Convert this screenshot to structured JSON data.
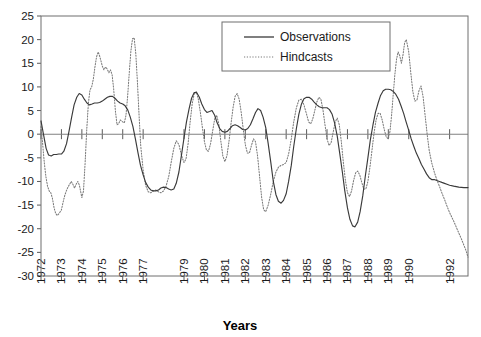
{
  "chart_data": {
    "type": "line",
    "title": "",
    "xlabel": "Years",
    "ylabel": "",
    "ylim": [
      -30,
      25
    ],
    "ytick_labels": [
      "25",
      "20",
      "15",
      "10",
      "5",
      "0",
      "-5",
      "-10",
      "-15",
      "-20",
      "-25",
      "-30"
    ],
    "ytick_values": [
      25,
      20,
      15,
      10,
      5,
      0,
      -5,
      -10,
      -15,
      -20,
      -25,
      -30
    ],
    "xtick_labels": [
      "1972",
      "1973",
      "1974",
      "1975",
      "1976",
      "1977",
      "1979",
      "1980",
      "1981",
      "1982",
      "1983",
      "1984",
      "1985",
      "1986",
      "1987",
      "1988",
      "1989",
      "1990",
      "1992"
    ],
    "xlim": [
      1972,
      1992.9
    ],
    "grid": false,
    "zero_line": true,
    "legend_position": "top-center-right",
    "legend": [
      "Observations",
      "Hindcasts"
    ],
    "series": [
      {
        "name": "Observations",
        "style": "solid",
        "color": "#3a3a3a",
        "x": [
          1972.0,
          1972.12,
          1972.25,
          1972.37,
          1972.5,
          1972.62,
          1972.75,
          1972.87,
          1973.0,
          1973.12,
          1973.25,
          1973.37,
          1973.5,
          1973.62,
          1973.75,
          1973.87,
          1974.0,
          1974.12,
          1974.25,
          1974.37,
          1974.5,
          1974.62,
          1974.75,
          1974.87,
          1975.0,
          1975.12,
          1975.25,
          1975.37,
          1975.5,
          1975.62,
          1975.75,
          1975.87,
          1976.0,
          1976.12,
          1976.25,
          1976.37,
          1976.5,
          1976.62,
          1976.75,
          1976.87,
          1977.0,
          1977.12,
          1977.25,
          1977.37,
          1977.5,
          1977.62,
          1977.75,
          1977.87,
          1978.0,
          1978.12,
          1978.25,
          1978.37,
          1978.5,
          1978.62,
          1978.75,
          1978.87,
          1979.0,
          1979.12,
          1979.25,
          1979.37,
          1979.5,
          1979.62,
          1979.75,
          1979.87,
          1980.0,
          1980.12,
          1980.25,
          1980.37,
          1980.5,
          1980.62,
          1980.75,
          1980.87,
          1981.0,
          1981.12,
          1981.25,
          1981.37,
          1981.5,
          1981.62,
          1981.75,
          1981.87,
          1982.0,
          1982.12,
          1982.25,
          1982.37,
          1982.5,
          1982.62,
          1982.75,
          1982.87,
          1983.0,
          1983.12,
          1983.25,
          1983.37,
          1983.5,
          1983.62,
          1983.75,
          1983.87,
          1984.0,
          1984.12,
          1984.25,
          1984.37,
          1984.5,
          1984.62,
          1984.75,
          1984.87,
          1985.0,
          1985.12,
          1985.25,
          1985.37,
          1985.5,
          1985.62,
          1985.75,
          1985.87,
          1986.0,
          1986.12,
          1986.25,
          1986.37,
          1986.5,
          1986.62,
          1986.75,
          1986.87,
          1987.0,
          1987.12,
          1987.25,
          1987.37,
          1987.5,
          1987.62,
          1987.75,
          1987.87,
          1988.0,
          1988.12,
          1988.25,
          1988.37,
          1988.5,
          1988.62,
          1988.75,
          1988.87,
          1989.0,
          1989.12,
          1989.25,
          1989.37,
          1989.5,
          1989.62,
          1989.75,
          1989.87,
          1990.0,
          1990.12,
          1990.25,
          1990.37,
          1990.5,
          1990.62,
          1990.75,
          1990.87,
          1991.0,
          1991.12,
          1991.25,
          1991.37,
          1991.5,
          1991.62,
          1991.75,
          1991.87,
          1992.0,
          1992.2,
          1992.45,
          1992.7,
          1992.9
        ],
        "y": [
          2.8,
          0.0,
          -3.0,
          -4.4,
          -4.6,
          -4.3,
          -4.3,
          -4.2,
          -4.2,
          -3.6,
          -2.0,
          0.6,
          3.6,
          6.2,
          7.8,
          8.6,
          8.3,
          7.4,
          6.6,
          6.2,
          6.4,
          6.6,
          6.6,
          6.7,
          7.0,
          7.4,
          7.8,
          8.0,
          8.0,
          7.6,
          7.0,
          6.6,
          6.4,
          6.0,
          5.1,
          3.6,
          1.6,
          -1.0,
          -4.0,
          -6.6,
          -8.6,
          -10.2,
          -11.2,
          -11.8,
          -12.0,
          -12.0,
          -11.8,
          -11.4,
          -11.2,
          -11.3,
          -11.6,
          -11.8,
          -11.6,
          -10.4,
          -8.0,
          -4.6,
          -0.8,
          2.6,
          5.4,
          7.6,
          8.8,
          8.8,
          7.8,
          6.4,
          5.2,
          4.6,
          4.8,
          5.0,
          4.0,
          2.4,
          1.2,
          0.6,
          0.4,
          0.6,
          1.2,
          1.8,
          2.0,
          1.8,
          1.4,
          1.0,
          0.9,
          1.2,
          2.0,
          3.2,
          4.6,
          5.4,
          5.0,
          3.6,
          1.4,
          -2.0,
          -6.0,
          -10.0,
          -12.8,
          -14.2,
          -14.6,
          -14.0,
          -12.6,
          -10.0,
          -6.6,
          -2.6,
          1.2,
          4.2,
          6.4,
          7.5,
          7.8,
          7.8,
          7.4,
          6.8,
          6.2,
          5.8,
          5.6,
          5.6,
          5.6,
          5.2,
          4.2,
          2.4,
          -0.4,
          -4.0,
          -8.0,
          -12.0,
          -15.6,
          -18.0,
          -19.4,
          -19.6,
          -18.6,
          -16.4,
          -13.0,
          -9.0,
          -5.0,
          -1.2,
          2.0,
          4.6,
          6.6,
          8.2,
          9.2,
          9.5,
          9.5,
          9.4,
          9.0,
          8.4,
          7.4,
          6.0,
          4.4,
          2.6,
          0.8,
          -1.0,
          -2.6,
          -4.0,
          -5.2,
          -6.4,
          -7.4,
          -8.4,
          -9.2,
          -9.6,
          -9.6,
          -9.8,
          -10.0,
          -10.2,
          -10.4,
          -10.6,
          -10.8,
          -11.0,
          -11.2,
          -11.3,
          -11.3
        ]
      },
      {
        "name": "Hindcasts",
        "style": "dotted",
        "color": "#7a7a7a",
        "x": [
          1972.0,
          1972.08,
          1972.16,
          1972.24,
          1972.32,
          1972.4,
          1972.48,
          1972.56,
          1972.64,
          1972.72,
          1972.8,
          1972.88,
          1973.0,
          1973.08,
          1973.16,
          1973.24,
          1973.32,
          1973.4,
          1973.48,
          1973.56,
          1973.64,
          1973.72,
          1973.8,
          1973.88,
          1974.0,
          1974.08,
          1974.16,
          1974.24,
          1974.32,
          1974.4,
          1974.48,
          1974.56,
          1974.64,
          1974.72,
          1974.8,
          1974.88,
          1975.0,
          1975.08,
          1975.16,
          1975.24,
          1975.32,
          1975.4,
          1975.48,
          1975.56,
          1975.64,
          1975.72,
          1975.8,
          1975.88,
          1976.0,
          1976.08,
          1976.16,
          1976.24,
          1976.32,
          1976.4,
          1976.48,
          1976.56,
          1976.64,
          1976.72,
          1976.8,
          1976.88,
          1977.0,
          1977.12,
          1977.25,
          1977.37,
          1977.5,
          1977.62,
          1977.75,
          1977.87,
          1978.0,
          1978.12,
          1978.25,
          1978.37,
          1978.5,
          1978.62,
          1978.75,
          1978.87,
          1979.0,
          1979.1,
          1979.2,
          1979.3,
          1979.4,
          1979.5,
          1979.6,
          1979.7,
          1979.8,
          1979.9,
          1980.0,
          1980.1,
          1980.2,
          1980.3,
          1980.4,
          1980.5,
          1980.6,
          1980.7,
          1980.8,
          1980.9,
          1981.0,
          1981.1,
          1981.2,
          1981.3,
          1981.4,
          1981.5,
          1981.6,
          1981.7,
          1981.8,
          1981.9,
          1982.0,
          1982.1,
          1982.2,
          1982.3,
          1982.4,
          1982.5,
          1982.6,
          1982.7,
          1982.8,
          1982.9,
          1983.0,
          1983.12,
          1983.25,
          1983.37,
          1983.5,
          1983.62,
          1983.75,
          1983.87,
          1984.0,
          1984.12,
          1984.25,
          1984.37,
          1984.5,
          1984.62,
          1984.75,
          1984.87,
          1985.0,
          1985.1,
          1985.2,
          1985.3,
          1985.4,
          1985.5,
          1985.6,
          1985.7,
          1985.8,
          1985.9,
          1986.0,
          1986.1,
          1986.2,
          1986.3,
          1986.4,
          1986.5,
          1986.6,
          1986.7,
          1986.8,
          1986.9,
          1987.0,
          1987.1,
          1987.2,
          1987.3,
          1987.4,
          1987.5,
          1987.6,
          1987.7,
          1987.8,
          1987.9,
          1988.0,
          1988.1,
          1988.2,
          1988.3,
          1988.4,
          1988.5,
          1988.6,
          1988.7,
          1988.8,
          1988.9,
          1989.0,
          1989.08,
          1989.16,
          1989.24,
          1989.32,
          1989.4,
          1989.48,
          1989.56,
          1989.64,
          1989.72,
          1989.8,
          1989.88,
          1990.0,
          1990.1,
          1990.2,
          1990.3,
          1990.4,
          1990.5,
          1990.6,
          1990.7,
          1990.8,
          1990.9,
          1991.0,
          1991.12,
          1991.25,
          1991.37,
          1991.5,
          1991.62,
          1991.75,
          1991.87,
          1992.0,
          1992.2,
          1992.4,
          1992.6,
          1992.8,
          1992.9
        ],
        "y": [
          1.6,
          -2.0,
          -6.0,
          -9.0,
          -11.0,
          -12.0,
          -12.4,
          -13.6,
          -15.6,
          -16.8,
          -17.2,
          -16.8,
          -16.0,
          -14.4,
          -13.0,
          -12.0,
          -11.2,
          -10.6,
          -10.0,
          -10.6,
          -11.4,
          -10.6,
          -10.0,
          -10.8,
          -13.4,
          -12.0,
          -6.0,
          1.0,
          6.6,
          9.4,
          10.0,
          11.6,
          14.2,
          16.4,
          17.4,
          16.4,
          14.4,
          13.6,
          14.2,
          13.8,
          13.0,
          13.6,
          12.6,
          9.4,
          5.0,
          2.0,
          2.2,
          3.0,
          2.6,
          2.4,
          4.0,
          8.0,
          13.0,
          17.6,
          20.2,
          20.4,
          17.0,
          11.0,
          4.0,
          -2.4,
          -7.6,
          -10.8,
          -12.2,
          -12.4,
          -12.0,
          -11.8,
          -12.2,
          -12.4,
          -12.0,
          -11.0,
          -9.0,
          -6.0,
          -3.0,
          -1.4,
          -2.2,
          -4.4,
          -6.0,
          -5.2,
          -2.0,
          2.6,
          6.4,
          8.6,
          9.0,
          7.4,
          4.6,
          1.4,
          -1.6,
          -3.4,
          -3.6,
          -2.0,
          0.6,
          3.2,
          4.0,
          2.2,
          -1.4,
          -4.6,
          -5.8,
          -4.6,
          -1.6,
          2.2,
          5.6,
          8.0,
          8.6,
          7.4,
          4.6,
          1.0,
          -2.2,
          -4.0,
          -4.0,
          -2.4,
          -1.0,
          -1.6,
          -4.6,
          -9.0,
          -13.4,
          -16.0,
          -16.4,
          -15.0,
          -12.6,
          -10.0,
          -8.0,
          -7.0,
          -6.6,
          -6.4,
          -6.0,
          -4.2,
          -1.0,
          2.6,
          5.6,
          7.2,
          7.4,
          6.2,
          4.2,
          2.6,
          2.2,
          3.2,
          5.0,
          6.8,
          7.8,
          7.4,
          5.2,
          2.0,
          -1.0,
          -2.4,
          -1.8,
          0.4,
          2.6,
          3.4,
          2.0,
          -1.6,
          -6.0,
          -9.8,
          -12.4,
          -13.2,
          -12.0,
          -9.8,
          -8.2,
          -7.8,
          -8.6,
          -10.2,
          -11.6,
          -11.6,
          -10.0,
          -7.0,
          -3.4,
          0.2,
          3.0,
          4.4,
          4.4,
          3.0,
          1.0,
          -0.6,
          -1.0,
          0.6,
          4.0,
          8.4,
          12.6,
          15.8,
          17.4,
          16.6,
          15.0,
          16.8,
          19.4,
          20.0,
          17.4,
          13.0,
          9.0,
          7.0,
          7.2,
          9.2,
          10.2,
          8.0,
          4.0,
          0.0,
          -3.4,
          -6.0,
          -8.0,
          -9.6,
          -11.0,
          -12.4,
          -13.8,
          -15.2,
          -16.6,
          -18.4,
          -20.4,
          -22.4,
          -24.6,
          -26.0
        ]
      }
    ]
  }
}
